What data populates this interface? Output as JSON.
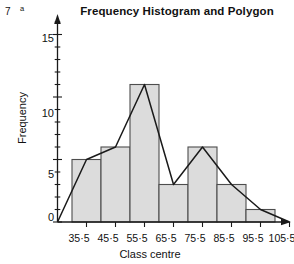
{
  "figure": {
    "question_number": "7",
    "question_part": "a",
    "title": "Frequency Histogram and Polygon"
  },
  "chart_data": {
    "type": "bar",
    "title": "Frequency Histogram and Polygon",
    "xlabel": "Class centre",
    "ylabel": "Frequency",
    "categories": [
      "35·5",
      "45·5",
      "55·5",
      "65·5",
      "75·5",
      "85·5",
      "95·5"
    ],
    "values": [
      5,
      6,
      11,
      3,
      6,
      3,
      1
    ],
    "xlim": [
      "25·5",
      "105·5"
    ],
    "ylim": [
      0,
      16
    ],
    "yticks": [
      0,
      5,
      10,
      15
    ],
    "ytick_labels": [
      "0",
      "5",
      "10",
      "15"
    ],
    "yminor_step": 1,
    "xtick_labels": [
      "35·5",
      "45·5",
      "55·5",
      "65·5",
      "75·5",
      "85·5",
      "95·5",
      "105·5"
    ],
    "grid": false,
    "legend": false,
    "bar_fill": "#dcdcdc",
    "bar_stroke": "#4d4d4d",
    "polygon_stroke": "#1a1a1a",
    "polygon_points": [
      {
        "x": "25·5",
        "y": 0
      },
      {
        "x": "35·5",
        "y": 5
      },
      {
        "x": "45·5",
        "y": 6
      },
      {
        "x": "55·5",
        "y": 11
      },
      {
        "x": "65·5",
        "y": 3
      },
      {
        "x": "75·5",
        "y": 6
      },
      {
        "x": "85·5",
        "y": 3
      },
      {
        "x": "95·5",
        "y": 1
      },
      {
        "x": "105·5",
        "y": 0
      }
    ],
    "series_name": "Frequency"
  }
}
